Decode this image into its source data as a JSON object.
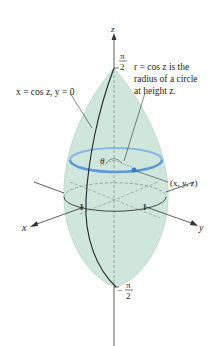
{
  "figure": {
    "colors": {
      "solid_fill": "#cfe6dc",
      "solid_edge": "#a9cfc0",
      "circle": "#5b9bd5",
      "point": "#2f7fd0",
      "axis": "#333333",
      "text": "#222222"
    },
    "axes": {
      "z_label": "z",
      "x_label": "x",
      "y_label": "y",
      "z_top_tick_num": "π",
      "z_top_tick_den": "2",
      "z_bottom_tick_sign": "−",
      "z_bottom_tick_num": "π",
      "z_bottom_tick_den": "2",
      "x_tick": "1",
      "y_tick": "1"
    },
    "annotations": {
      "curve_label": "x = cos z, y = 0",
      "radius_label_line1": "r = cos z is the",
      "radius_label_line2": "radius of a circle",
      "radius_label_line3": "at height z.",
      "point_label": "(x, y, z)",
      "angle_label": "θ"
    }
  }
}
